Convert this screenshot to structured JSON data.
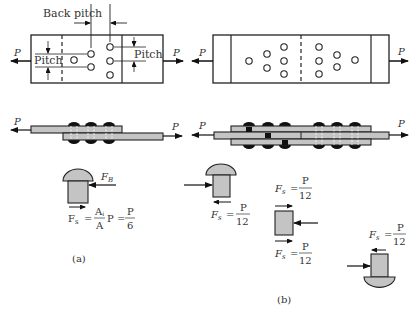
{
  "colors": {
    "stroke": "#222222",
    "fill_gray": "#c4c4c4",
    "rivet_head": "#111111",
    "background": "#ffffff"
  },
  "panel_a": {
    "labels": {
      "back_pitch": "Back pitch",
      "pitch_left": "Pitch",
      "pitch_right": "Pitch",
      "load_left": "P",
      "load_right": "P",
      "side_load_left": "P",
      "side_load_right": "P",
      "force_bearing": "F",
      "force_bearing_sub": "B"
    },
    "formula": {
      "lhs": "F",
      "lhs_sub": "s",
      "eq": "=",
      "frac1_num": "A",
      "frac1_num_sub": "i",
      "frac1_den": "A",
      "mid": "P =",
      "frac2_num": "P",
      "frac2_den": "6"
    },
    "caption": "(a)"
  },
  "panel_b": {
    "labels": {
      "load_left": "P",
      "load_right": "P",
      "side_load_left": "P",
      "side_load_right": "P"
    },
    "formulas": [
      {
        "lhs": "F",
        "lhs_sub": "s",
        "eq": "=",
        "num": "P",
        "den": "12"
      },
      {
        "lhs": "F",
        "lhs_sub": "s",
        "eq": "=",
        "num": "P",
        "den": "12"
      },
      {
        "lhs": "F",
        "lhs_sub": "s",
        "eq": "=",
        "num": "P",
        "den": "12"
      },
      {
        "lhs": "F",
        "lhs_sub": "s",
        "eq": "=",
        "num": "P",
        "den": "12"
      }
    ],
    "caption": "(b)"
  }
}
